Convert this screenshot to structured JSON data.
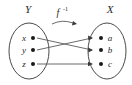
{
  "diagram": {
    "title_left": "Y",
    "title_right": "X",
    "function_label": "f",
    "function_exponent": "-1",
    "domain_set": {
      "name": "Y",
      "elements": [
        {
          "label": "x",
          "cx": 33,
          "cy": 38
        },
        {
          "label": "y",
          "cx": 33,
          "cy": 50
        },
        {
          "label": "z",
          "cx": 33,
          "cy": 64
        }
      ]
    },
    "codomain_set": {
      "name": "X",
      "elements": [
        {
          "label": "a",
          "cx": 101,
          "cy": 38
        },
        {
          "label": "b",
          "cx": 101,
          "cy": 50
        },
        {
          "label": "c",
          "cx": 101,
          "cy": 64
        }
      ]
    },
    "mappings": [
      {
        "from": "x",
        "to": "b",
        "kind": "crossing-down"
      },
      {
        "from": "y",
        "to": "a",
        "kind": "crossing-up"
      },
      {
        "from": "z",
        "to": "c",
        "kind": "straight"
      }
    ],
    "colors": {
      "stroke": "#4a4a4a",
      "line": "#5a5a5a",
      "dot": "#1a1a1a",
      "text": "#2b2b2b",
      "background": "#ffffff"
    }
  }
}
